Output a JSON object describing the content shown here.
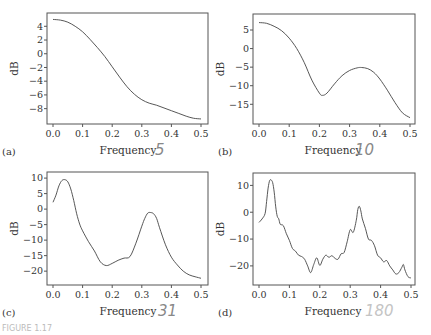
{
  "figure_caption": "FIGURE 1.17",
  "chart_data": [
    {
      "type": "line",
      "panel_label": "(a)",
      "annotation": "5",
      "xlabel": "Frequency",
      "ylabel": "dB",
      "xlim": [
        0,
        0.5
      ],
      "ylim": [
        -9.8,
        5.5
      ],
      "xticks": [
        0.0,
        0.1,
        0.2,
        0.3,
        0.4,
        0.5
      ],
      "xtick_labels": [
        "0.0",
        "0.1",
        "0.2",
        "0.3",
        "0.4",
        "0.5"
      ],
      "yticks": [
        4,
        2,
        0,
        -2,
        -4,
        -6,
        -8
      ],
      "ytick_labels": [
        "4",
        "2",
        "0",
        "−2",
        "−4",
        "−6",
        "−8"
      ],
      "x": [
        0.0,
        0.025,
        0.05,
        0.075,
        0.1,
        0.125,
        0.15,
        0.175,
        0.2,
        0.225,
        0.25,
        0.275,
        0.3,
        0.325,
        0.35,
        0.375,
        0.4,
        0.425,
        0.45,
        0.475,
        0.5
      ],
      "y": [
        5.0,
        4.9,
        4.6,
        4.0,
        3.2,
        2.1,
        0.9,
        -0.4,
        -1.9,
        -3.4,
        -4.8,
        -5.9,
        -6.7,
        -7.2,
        -7.5,
        -7.9,
        -8.3,
        -8.7,
        -9.1,
        -9.4,
        -9.5
      ]
    },
    {
      "type": "line",
      "panel_label": "(b)",
      "annotation": "10",
      "xlabel": "Frequency",
      "ylabel": "dB",
      "xlim": [
        0,
        0.5
      ],
      "ylim": [
        -19.5,
        8.5
      ],
      "xticks": [
        0.0,
        0.1,
        0.2,
        0.3,
        0.4,
        0.5
      ],
      "xtick_labels": [
        "0.0",
        "0.1",
        "0.2",
        "0.3",
        "0.4",
        "0.5"
      ],
      "yticks": [
        5,
        0,
        -5,
        -10,
        -15
      ],
      "ytick_labels": [
        "5",
        "0",
        "−5",
        "−10",
        "−15"
      ],
      "x": [
        0.0,
        0.025,
        0.05,
        0.075,
        0.1,
        0.125,
        0.15,
        0.175,
        0.2,
        0.21,
        0.225,
        0.25,
        0.275,
        0.3,
        0.325,
        0.34,
        0.36,
        0.38,
        0.4,
        0.425,
        0.45,
        0.475,
        0.5
      ],
      "y": [
        7.0,
        6.8,
        6.0,
        4.8,
        2.8,
        0.0,
        -3.8,
        -8.5,
        -12.0,
        -12.6,
        -12.0,
        -9.5,
        -7.3,
        -5.9,
        -5.2,
        -5.1,
        -5.4,
        -6.4,
        -8.2,
        -11.2,
        -14.5,
        -17.3,
        -18.6
      ]
    },
    {
      "type": "line",
      "panel_label": "(c)",
      "annotation": "31",
      "xlabel": "Frequency",
      "ylabel": "dB",
      "xlim": [
        0,
        0.5
      ],
      "ylim": [
        -23.5,
        11
      ],
      "xticks": [
        0.0,
        0.1,
        0.2,
        0.3,
        0.4,
        0.5
      ],
      "xtick_labels": [
        "0.0",
        "0.1",
        "0.2",
        "0.3",
        "0.4",
        "0.5"
      ],
      "yticks": [
        10,
        5,
        0,
        -5,
        -10,
        -15,
        -20
      ],
      "ytick_labels": [
        "10",
        "5",
        "0",
        "−5",
        "−10",
        "−15",
        "−20"
      ],
      "x": [
        0.0,
        0.01,
        0.02,
        0.03,
        0.04,
        0.05,
        0.06,
        0.07,
        0.08,
        0.09,
        0.1,
        0.12,
        0.14,
        0.16,
        0.18,
        0.2,
        0.22,
        0.24,
        0.26,
        0.28,
        0.3,
        0.31,
        0.32,
        0.33,
        0.34,
        0.35,
        0.36,
        0.38,
        0.4,
        0.42,
        0.44,
        0.46,
        0.48,
        0.5
      ],
      "y": [
        2.2,
        4.5,
        7.5,
        9.2,
        9.5,
        8.8,
        6.5,
        2.8,
        -1.5,
        -4.8,
        -7.0,
        -10.5,
        -13.5,
        -17.0,
        -18.2,
        -17.5,
        -16.5,
        -15.8,
        -15.3,
        -11.0,
        -5.5,
        -3.0,
        -1.3,
        -1.1,
        -1.5,
        -3.0,
        -6.0,
        -11.5,
        -15.5,
        -18.0,
        -20.0,
        -21.2,
        -21.8,
        -22.3
      ]
    },
    {
      "type": "line",
      "panel_label": "(d)",
      "annotation": "180",
      "xlabel": "Frequency",
      "ylabel": "dB",
      "xlim": [
        0,
        0.5
      ],
      "ylim": [
        -26,
        13.5
      ],
      "xticks": [
        0.0,
        0.1,
        0.2,
        0.3,
        0.4,
        0.5
      ],
      "xtick_labels": [
        "0.0",
        "0.1",
        "0.2",
        "0.3",
        "0.4",
        "0.5"
      ],
      "yticks": [
        10,
        0,
        -10,
        -20
      ],
      "ytick_labels": [
        "10",
        "0",
        "−10",
        "−20"
      ],
      "x": [
        0.0,
        0.01,
        0.02,
        0.025,
        0.03,
        0.035,
        0.04,
        0.045,
        0.05,
        0.055,
        0.06,
        0.065,
        0.07,
        0.08,
        0.09,
        0.1,
        0.11,
        0.12,
        0.13,
        0.14,
        0.15,
        0.16,
        0.17,
        0.18,
        0.19,
        0.2,
        0.21,
        0.22,
        0.23,
        0.24,
        0.25,
        0.26,
        0.27,
        0.28,
        0.29,
        0.3,
        0.31,
        0.32,
        0.325,
        0.33,
        0.335,
        0.34,
        0.35,
        0.36,
        0.37,
        0.38,
        0.39,
        0.4,
        0.41,
        0.42,
        0.43,
        0.44,
        0.45,
        0.46,
        0.47,
        0.475,
        0.48,
        0.49,
        0.5
      ],
      "y": [
        -3.8,
        -2.5,
        -0.5,
        4.0,
        9.0,
        11.8,
        12.0,
        11.0,
        7.5,
        2.0,
        -1.5,
        -2.5,
        -4.5,
        -5.0,
        -8.0,
        -10.5,
        -13.5,
        -14.5,
        -16.0,
        -16.5,
        -17.5,
        -20.0,
        -22.5,
        -19.5,
        -17.0,
        -19.8,
        -17.5,
        -16.0,
        -16.8,
        -16.2,
        -17.2,
        -17.5,
        -15.5,
        -15.0,
        -11.0,
        -6.5,
        -7.5,
        -3.0,
        1.0,
        2.2,
        0.5,
        -2.5,
        -6.0,
        -10.0,
        -10.5,
        -12.5,
        -16.0,
        -17.0,
        -18.5,
        -18.0,
        -20.0,
        -21.5,
        -23.0,
        -22.5,
        -20.5,
        -19.5,
        -21.5,
        -24.0,
        -24.5
      ]
    }
  ]
}
